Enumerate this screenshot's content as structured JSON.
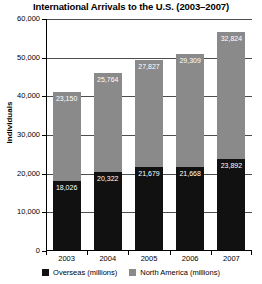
{
  "chart_data": {
    "type": "bar",
    "subtype": "stacked-bar",
    "title": "International Arrivals to the U.S. (2003–2007)",
    "xlabel": "",
    "ylabel": "Individuals",
    "categories": [
      "2003",
      "2004",
      "2005",
      "2006",
      "2007"
    ],
    "series": [
      {
        "name": "Overseas (millions)",
        "color": "#111111",
        "values": [
          18026,
          20322,
          21679,
          21668,
          23892
        ],
        "value_labels": [
          "18,026",
          "20,322",
          "21,679",
          "21,668",
          "23,892"
        ]
      },
      {
        "name": "North America (millions)",
        "color": "#8a8a8a",
        "values": [
          23150,
          25764,
          27827,
          29309,
          32824
        ],
        "value_labels": [
          "23,150",
          "25,764",
          "27,827",
          "29,309",
          "32,824"
        ]
      }
    ],
    "totals": [
      41176,
      46086,
      49506,
      50977,
      56716
    ],
    "ylim": [
      0,
      60000
    ],
    "ytick_values": [
      0,
      10000,
      20000,
      30000,
      40000,
      50000,
      60000
    ],
    "ytick_labels": [
      "0",
      "10,000",
      "20,000",
      "30,000",
      "40,000",
      "50,000",
      "60,000"
    ],
    "grid": true,
    "grid_axis": "y",
    "legend_position": "bottom"
  },
  "legend": {
    "items": [
      {
        "label": "Overseas (millions)",
        "color": "#111111"
      },
      {
        "label": "North America (millions)",
        "color": "#8a8a8a"
      }
    ]
  }
}
